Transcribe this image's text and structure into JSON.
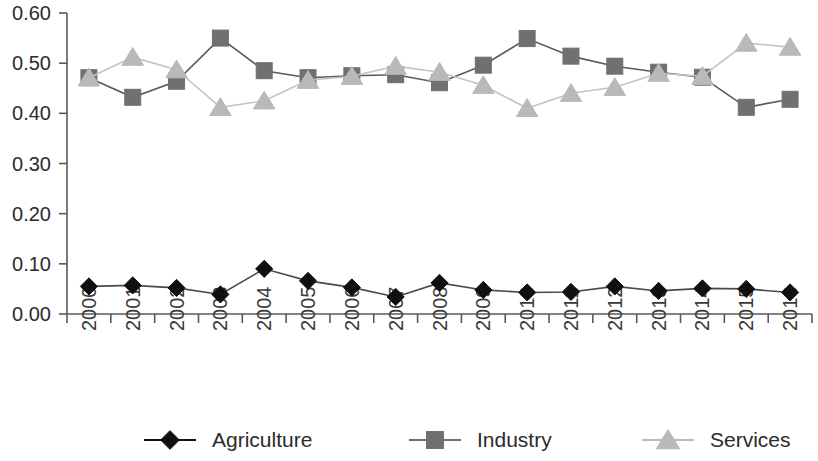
{
  "chart_data": {
    "type": "line",
    "title": "",
    "subtitle": "",
    "xlabel": "",
    "ylabel": "",
    "categories": [
      "2000",
      "2001",
      "2002",
      "2003",
      "2004",
      "2005",
      "2006",
      "2007",
      "2008",
      "2009",
      "2010",
      "2011",
      "2012",
      "2013",
      "2014",
      "2015",
      "2016"
    ],
    "ylim": [
      0.0,
      0.6
    ],
    "ytick_labels": [
      "0.00",
      "0.10",
      "0.20",
      "0.30",
      "0.40",
      "0.50",
      "0.60"
    ],
    "ytick_values": [
      0.0,
      0.1,
      0.2,
      0.3,
      0.4,
      0.5,
      0.6
    ],
    "grid": false,
    "legend_position": "bottom",
    "series": [
      {
        "name": "Agriculture",
        "marker": "diamond",
        "color": "#101010",
        "line_color": "#4a4a4a",
        "values": [
          0.055,
          0.057,
          0.052,
          0.039,
          0.09,
          0.066,
          0.053,
          0.034,
          0.062,
          0.048,
          0.043,
          0.044,
          0.055,
          0.046,
          0.051,
          0.05,
          0.043
        ]
      },
      {
        "name": "Industry",
        "marker": "square",
        "color": "#707070",
        "line_color": "#5a5a5a",
        "values": [
          0.471,
          0.432,
          0.464,
          0.55,
          0.485,
          0.471,
          0.475,
          0.477,
          0.461,
          0.496,
          0.549,
          0.514,
          0.494,
          0.482,
          0.472,
          0.412,
          0.428
        ]
      },
      {
        "name": "Services",
        "marker": "triangle",
        "color": "#b9b9b9",
        "line_color": "#c4c4c4",
        "values": [
          0.471,
          0.512,
          0.487,
          0.412,
          0.425,
          0.466,
          0.474,
          0.494,
          0.482,
          0.456,
          0.41,
          0.44,
          0.452,
          0.48,
          0.474,
          0.54,
          0.532
        ]
      }
    ]
  },
  "legend": {
    "items": [
      {
        "label": "Agriculture",
        "marker": "diamond",
        "color": "#101010"
      },
      {
        "label": "Industry",
        "marker": "square",
        "color": "#707070"
      },
      {
        "label": "Services",
        "marker": "triangle",
        "color": "#b9b9b9"
      }
    ]
  },
  "axes": {
    "y_axis_name": "value-axis",
    "x_axis_name": "year-axis"
  }
}
